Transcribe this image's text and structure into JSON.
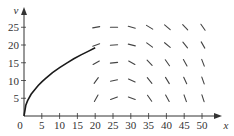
{
  "chart_data": {
    "type": "line",
    "title": "",
    "xlabel": "x",
    "ylabel": "v",
    "xlim": [
      0,
      55
    ],
    "ylim": [
      0,
      30
    ],
    "grid": false,
    "legend": null,
    "x_ticks": [
      0,
      5,
      10,
      15,
      20,
      25,
      30,
      35,
      40,
      45,
      50
    ],
    "y_ticks": [
      5,
      10,
      15,
      20,
      25
    ],
    "x_tick_labels": [
      "0",
      "5",
      "10",
      "15",
      "20",
      "25",
      "30",
      "35",
      "40",
      "45",
      "50"
    ],
    "y_tick_labels": [
      "5",
      "10",
      "15",
      "20",
      "25"
    ],
    "series": [
      {
        "name": "solution curve",
        "x": [
          0,
          0.5,
          1,
          2,
          3,
          4,
          5,
          6,
          8,
          10,
          12,
          14,
          16,
          18,
          20
        ],
        "values": [
          0,
          3.0,
          4.3,
          6.1,
          7.4,
          8.6,
          9.6,
          10.5,
          12.2,
          13.6,
          14.9,
          16.1,
          17.2,
          18.2,
          19.2
        ]
      }
    ],
    "slope_field": {
      "x": [
        20,
        25,
        30,
        35,
        40,
        45,
        50
      ],
      "y": [
        5,
        10,
        15,
        20,
        25
      ],
      "description": "short line segments; near-horizontal/slightly positive at small x and large y, becoming steeply negative toward large x",
      "angles_deg": [
        [
          60,
          20,
          -20,
          -55,
          -60,
          -70,
          -72
        ],
        [
          55,
          12,
          -25,
          -50,
          -58,
          -65,
          -70
        ],
        [
          30,
          5,
          -30,
          -45,
          -55,
          -60,
          -68
        ],
        [
          20,
          3,
          -15,
          -35,
          -40,
          -50,
          -60
        ],
        [
          10,
          0,
          -15,
          -30,
          -40,
          -45,
          -55
        ]
      ]
    }
  }
}
